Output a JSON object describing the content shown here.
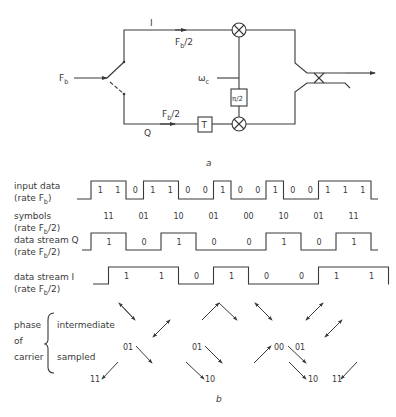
{
  "part_a": {
    "caption": "a",
    "input_label": "F",
    "input_sub": "b",
    "branch_I_label": "I",
    "branch_Q_label": "Q",
    "rate_I_main": "F",
    "rate_I_sub": "b",
    "rate_I_div": "/2",
    "rate_Q_main": "F",
    "rate_Q_sub": "b",
    "rate_Q_div": "/2",
    "carrier_label": "ω",
    "carrier_sub": "c",
    "phase_shift_label": "π/2",
    "delay_label": "T"
  },
  "part_b": {
    "caption": "b",
    "rows": [
      {
        "label": "input data",
        "rate_main": "(rate F",
        "rate_sub": "b",
        "rate_tail": ")"
      },
      {
        "label": "symbols",
        "rate_main": "(rate F",
        "rate_sub": "b",
        "rate_tail": "/2)"
      },
      {
        "label": "data stream Q",
        "rate_main": "(rate F",
        "rate_sub": "b",
        "rate_tail": "/2)"
      },
      {
        "label": "data stream I",
        "rate_main": "(rate F",
        "rate_sub": "b",
        "rate_tail": "/2)"
      }
    ],
    "input_bits": [
      "1",
      "1",
      "0",
      "1",
      "1",
      "0",
      "0",
      "1",
      "0",
      "0",
      "1",
      "0",
      "0",
      "1",
      "1",
      "1"
    ],
    "symbols": [
      "11",
      "01",
      "10",
      "01",
      "00",
      "10",
      "01",
      "11"
    ],
    "q_bits": [
      "1",
      "0",
      "1",
      "0",
      "0",
      "1",
      "0",
      "1"
    ],
    "i_bits": [
      "1",
      "1",
      "0",
      "1",
      "0",
      "0",
      "1",
      "1"
    ],
    "phase_group": {
      "label_1": "phase",
      "label_2": "of",
      "label_3": "carrier",
      "intermediate": "intermediate",
      "sampled": "sampled"
    },
    "phase_labels": [
      "11",
      "01",
      "01",
      "10",
      "00",
      "01",
      "10",
      "11"
    ]
  }
}
